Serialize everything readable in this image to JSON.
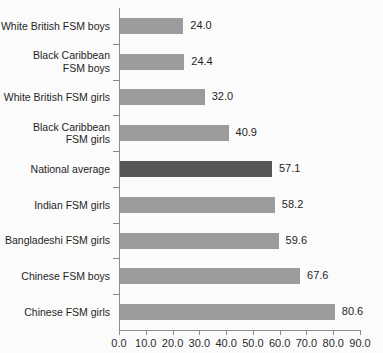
{
  "chart_data": {
    "type": "bar",
    "orientation": "horizontal",
    "title": "",
    "subtitle": "",
    "xlabel": "",
    "ylabel": "",
    "xlim": [
      0.0,
      90.0
    ],
    "xticks": [
      "0.0",
      "10.0",
      "20.0",
      "30.0",
      "40.0",
      "50.0",
      "60.0",
      "70.0",
      "80.0",
      "90.0"
    ],
    "xtick_values": [
      0,
      10,
      20,
      30,
      40,
      50,
      60,
      70,
      80,
      90
    ],
    "grid": false,
    "legend": "none",
    "categories": [
      "White British FSM boys",
      "Black Caribbean\nFSM boys",
      "White British FSM girls",
      "Black Caribbean\nFSM girls",
      "National average",
      "Indian FSM girls",
      "Bangladeshi FSM girls",
      "Chinese FSM boys",
      "Chinese FSM girls"
    ],
    "values": [
      24.0,
      24.4,
      32.0,
      40.9,
      57.1,
      58.2,
      59.6,
      67.6,
      80.6
    ],
    "value_labels": [
      "24.0",
      "24.4",
      "32.0",
      "40.9",
      "57.1",
      "58.2",
      "59.6",
      "67.6",
      "80.6"
    ],
    "highlight_index": 4,
    "colors": {
      "bar": "#9b9b9b",
      "bar_highlight": "#565656",
      "axis": "#8d8d8d",
      "text": "#1f1f1f",
      "background": "#fbfbfb"
    }
  },
  "bleed_text": "faint reverse-side print"
}
